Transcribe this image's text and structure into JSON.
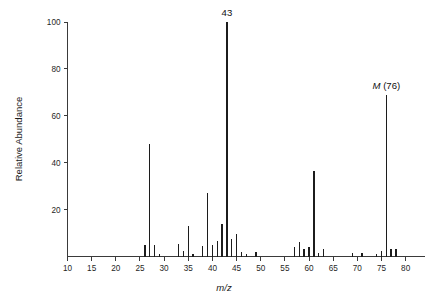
{
  "chart_data": {
    "type": "bar",
    "title": "",
    "subtitle": "",
    "xlabel": "m/z",
    "ylabel": "Relative Abundance",
    "xlim": [
      10,
      84
    ],
    "ylim": [
      0,
      100
    ],
    "grid": false,
    "legend": null,
    "x_ticks": [
      10,
      15,
      20,
      25,
      30,
      35,
      40,
      45,
      50,
      55,
      60,
      65,
      70,
      75,
      80
    ],
    "y_ticks": [
      20,
      40,
      60,
      80,
      100
    ],
    "x_tick_labels": [
      "10",
      "15",
      "20",
      "25",
      "30",
      "35",
      "40",
      "45",
      "50",
      "55",
      "60",
      "65",
      "70",
      "75",
      "80"
    ],
    "y_tick_labels": [
      "20",
      "40",
      "60",
      "80",
      "100"
    ],
    "series": [
      {
        "name": "Mass spectrum",
        "x": [
          26,
          27,
          28,
          29,
          33,
          34,
          35,
          36,
          38,
          39,
          40,
          41,
          42,
          43,
          44,
          45,
          46,
          47,
          49,
          57,
          58,
          59,
          60,
          61,
          62,
          63,
          69,
          71,
          74,
          75,
          76,
          77,
          78
        ],
        "values": [
          5,
          48,
          5,
          1.2,
          5.5,
          2.5,
          13,
          1.2,
          4.5,
          27,
          5,
          6.5,
          14,
          100,
          7.5,
          9.5,
          2,
          1,
          2,
          4,
          6,
          3,
          4,
          36.5,
          1.5,
          3,
          1.5,
          1.5,
          1,
          2.5,
          69,
          3,
          3
        ]
      }
    ],
    "annotations": [
      {
        "name": "base-peak-label",
        "text": "43",
        "x": 43,
        "y": 100
      },
      {
        "name": "molecular-ion-label",
        "text_italic": "M",
        "text_rest": " (76)",
        "x": 76,
        "y": 69
      }
    ]
  },
  "axes": {
    "y_axis_title": "Relative Abundance",
    "x_axis_title": "m/z"
  }
}
